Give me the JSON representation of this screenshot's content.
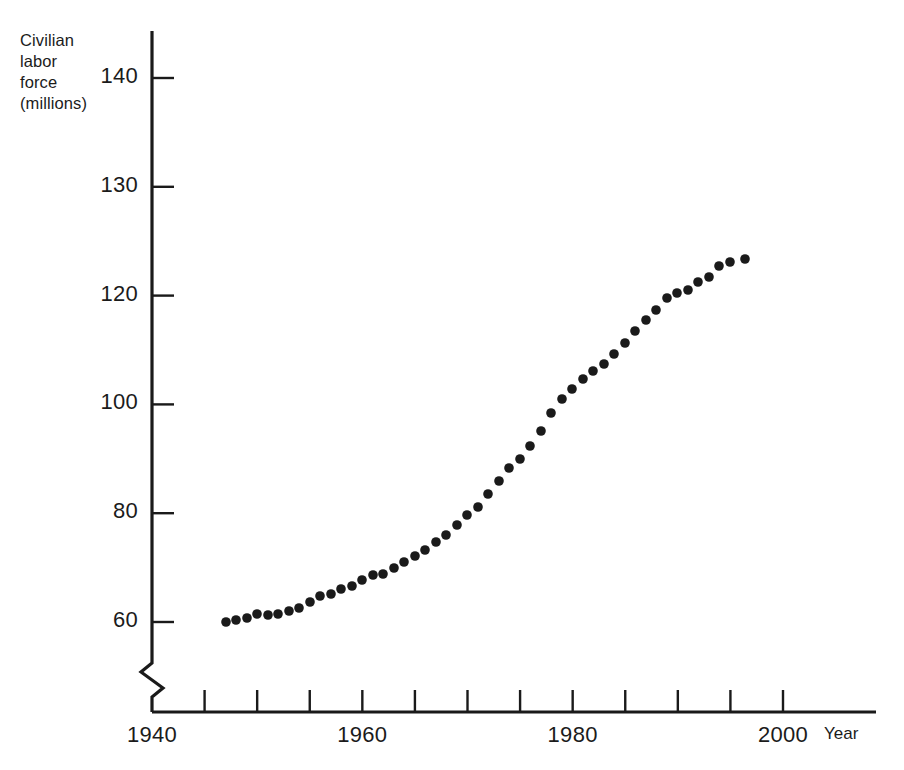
{
  "chart_data": {
    "type": "scatter",
    "title": "",
    "subtitle": "",
    "ylabel_lines": [
      "Civilian",
      "labor",
      "force",
      "(millions)"
    ],
    "ylabel": "Civilian labor force (millions)",
    "xlabel": "Year",
    "grid": false,
    "legend": null,
    "axis_break": {
      "axis": "y",
      "note": "zigzag break between 0 and 60 on vertical axis; also non-linear gap between 100 and 120"
    },
    "yticks": [
      {
        "label": "140",
        "value": 140
      },
      {
        "label": "130",
        "value": 130
      },
      {
        "label": "120",
        "value": 120
      },
      {
        "label": "100",
        "value": 100
      },
      {
        "label": "80",
        "value": 80
      },
      {
        "label": "60",
        "value": 60
      }
    ],
    "xticks_major": [
      {
        "label": "1940",
        "value": 1940
      },
      {
        "label": "1960",
        "value": 1960
      },
      {
        "label": "1980",
        "value": 1980
      },
      {
        "label": "2000",
        "value": 2000
      }
    ],
    "xticks_minor": [
      1945,
      1950,
      1955,
      1960,
      1965,
      1970,
      1975,
      1980,
      1985,
      1990,
      1995,
      2000
    ],
    "xlim": [
      1940,
      2002
    ],
    "ylim": [
      55,
      145
    ],
    "marker": {
      "shape": "circle",
      "color": "#1a1a1a",
      "size_px": 9
    },
    "x": [
      1947,
      1948,
      1949,
      1950,
      1951,
      1952,
      1953,
      1954,
      1955,
      1956,
      1957,
      1958,
      1959,
      1960,
      1961,
      1962,
      1963,
      1964,
      1965,
      1966,
      1967,
      1968,
      1969,
      1970,
      1971,
      1972,
      1973,
      1974,
      1975,
      1976,
      1977,
      1978,
      1979,
      1980,
      1981,
      1982,
      1983,
      1984,
      1985,
      1986,
      1987,
      1988,
      1989,
      1990,
      1991,
      1992,
      1993,
      1994,
      1995,
      1996
    ],
    "values": [
      59.4,
      60.6,
      61.3,
      62.2,
      62.0,
      62.1,
      63.0,
      63.6,
      65.0,
      66.6,
      66.9,
      67.6,
      68.4,
      69.6,
      70.5,
      70.6,
      71.8,
      73.1,
      74.5,
      75.8,
      77.3,
      78.7,
      80.7,
      82.8,
      84.4,
      87.0,
      89.4,
      91.9,
      93.8,
      96.2,
      99.0,
      102.3,
      105.0,
      106.9,
      108.7,
      110.2,
      111.6,
      113.5,
      115.5,
      117.8,
      119.9,
      121.7,
      123.9,
      124.8,
      125.3,
      127.0,
      128.0,
      131.1,
      132.3,
      133.9
    ],
    "plotted_points_px": [
      [
        226,
        622
      ],
      [
        236,
        620
      ],
      [
        247,
        618
      ],
      [
        257,
        614
      ],
      [
        268,
        615
      ],
      [
        278,
        614
      ],
      [
        289,
        611
      ],
      [
        299,
        608
      ],
      [
        310,
        602
      ],
      [
        320,
        596
      ],
      [
        331,
        594
      ],
      [
        341,
        589
      ],
      [
        352,
        586
      ],
      [
        362,
        580
      ],
      [
        373,
        575
      ],
      [
        383,
        574
      ],
      [
        394,
        568
      ],
      [
        404,
        562
      ],
      [
        415,
        556
      ],
      [
        425,
        550
      ],
      [
        436,
        542
      ],
      [
        446,
        535
      ],
      [
        457,
        525
      ],
      [
        467,
        515
      ],
      [
        478,
        507
      ],
      [
        488,
        494
      ],
      [
        499,
        481
      ],
      [
        509,
        468
      ],
      [
        520,
        459
      ],
      [
        530,
        446
      ],
      [
        541,
        431
      ],
      [
        551,
        413
      ],
      [
        562,
        399
      ],
      [
        572,
        389
      ],
      [
        583,
        379
      ],
      [
        593,
        371
      ],
      [
        604,
        364
      ],
      [
        614,
        354
      ],
      [
        625,
        343
      ],
      [
        635,
        331
      ],
      [
        646,
        320
      ],
      [
        656,
        310
      ],
      [
        667,
        298
      ],
      [
        677,
        293
      ],
      [
        688,
        290
      ],
      [
        698,
        282
      ],
      [
        709,
        277
      ],
      [
        719,
        266
      ],
      [
        730,
        262
      ],
      [
        745,
        259
      ]
    ]
  },
  "figure": {
    "background_color": "#ffffff",
    "ink_color": "#1a1a1a",
    "marker_color": "#1a1a1a"
  }
}
